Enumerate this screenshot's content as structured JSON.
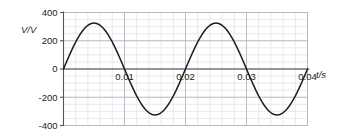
{
  "chart_data": {
    "type": "line",
    "title": "",
    "subtitle": "",
    "xlabel": "t/s",
    "ylabel": "V/V",
    "xlim": [
      0,
      0.04
    ],
    "ylim": [
      -400,
      400
    ],
    "grid": true,
    "minor_grid": true,
    "legend": false,
    "x_ticks": [
      0.01,
      0.02,
      0.03,
      0.04
    ],
    "x_tick_labels": [
      "0.01",
      "0.02",
      "0.03",
      "0.04"
    ],
    "y_ticks": [
      400,
      200,
      0,
      -200,
      -400
    ],
    "y_tick_labels": [
      "400",
      "200",
      "0",
      "-200",
      "-400"
    ],
    "annotations": [],
    "series": [
      {
        "name": "V(t)",
        "form": "sine",
        "amplitude": 325,
        "period": 0.02,
        "frequency": 50,
        "phase": 0,
        "color": "#1c1c1c",
        "x": [
          0,
          0.0005,
          0.001,
          0.0015,
          0.002,
          0.0025,
          0.003,
          0.0035,
          0.004,
          0.0045,
          0.005,
          0.0055,
          0.006,
          0.0065,
          0.007,
          0.0075,
          0.008,
          0.0085,
          0.009,
          0.0095,
          0.01,
          0.0105,
          0.011,
          0.0115,
          0.012,
          0.0125,
          0.013,
          0.0135,
          0.014,
          0.0145,
          0.015,
          0.0155,
          0.016,
          0.0165,
          0.017,
          0.0175,
          0.018,
          0.0185,
          0.019,
          0.0195,
          0.02,
          0.0205,
          0.021,
          0.0215,
          0.022,
          0.0225,
          0.023,
          0.0235,
          0.024,
          0.0245,
          0.025,
          0.0255,
          0.026,
          0.0265,
          0.027,
          0.0275,
          0.028,
          0.0285,
          0.029,
          0.0295,
          0.03,
          0.0305,
          0.031,
          0.0315,
          0.032,
          0.0325,
          0.033,
          0.0335,
          0.034,
          0.0345,
          0.035,
          0.0355,
          0.036,
          0.0365,
          0.037,
          0.0375,
          0.038,
          0.0385,
          0.039,
          0.0395,
          0.04
        ],
        "y": [
          0,
          50.2,
          99.1,
          145.6,
          188.6,
          227.0,
          259.9,
          286.6,
          306.3,
          318.8,
          325.0,
          318.8,
          306.3,
          286.6,
          259.9,
          227.0,
          188.6,
          145.6,
          99.1,
          50.2,
          0,
          -50.2,
          -99.1,
          -145.6,
          -188.6,
          -227.0,
          -259.9,
          -286.6,
          -306.3,
          -318.8,
          -325.0,
          -318.8,
          -306.3,
          -286.6,
          -259.9,
          -227.0,
          -188.6,
          -145.6,
          -99.1,
          -50.2,
          0,
          50.2,
          99.1,
          145.6,
          188.6,
          227.0,
          259.9,
          286.6,
          306.3,
          318.8,
          325.0,
          318.8,
          306.3,
          286.6,
          259.9,
          227.0,
          188.6,
          145.6,
          99.1,
          50.2,
          0,
          -50.2,
          -99.1,
          -145.6,
          -188.6,
          -227.0,
          -259.9,
          -286.6,
          -306.3,
          -318.8,
          -325.0,
          -318.8,
          -306.3,
          -286.6,
          -259.9,
          -227.0,
          -188.6,
          -145.6,
          -99.1,
          -50.2,
          0
        ]
      }
    ],
    "colors": {
      "curve": "#1c1c1c",
      "axis": "#555555",
      "major_grid": "#b8b8c4",
      "minor_grid": "#dcdce4",
      "text": "#1c1c1c",
      "background": "#ffffff"
    }
  }
}
